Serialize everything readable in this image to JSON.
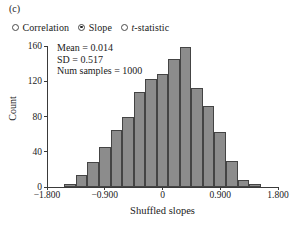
{
  "panel": {
    "label": "(c)"
  },
  "controls": {
    "name": "statistic-selector",
    "options": [
      {
        "label": "Correlation",
        "selected": false,
        "italic_prefix": ""
      },
      {
        "label": "Slope",
        "selected": true,
        "italic_prefix": ""
      },
      {
        "label": "t-statistic",
        "selected": false,
        "italic_prefix": "t"
      }
    ]
  },
  "stats": {
    "mean_line": "Mean = 0.014",
    "sd_line": "SD = 0.517",
    "samples_line": "Num samples = 1000"
  },
  "colors": {
    "bar_fill": "#8c8c8c",
    "bar_stroke": "#444444",
    "axis": "#3a3a3a",
    "text": "#1a1a1a",
    "background": "#ffffff"
  },
  "chart_data": {
    "type": "bar",
    "title": "",
    "subtitle": "",
    "xlabel": "Shuffled slopes",
    "ylabel": "Count",
    "xlim": [
      -1.8,
      1.8
    ],
    "ylim": [
      0,
      160
    ],
    "xticks": [
      -1.8,
      -0.9,
      0,
      0.9,
      1.8
    ],
    "xticklabels": [
      "−1.800",
      "−0.900",
      "0",
      "0.900",
      "1.800"
    ],
    "yticks": [
      0,
      40,
      80,
      120,
      160
    ],
    "yticklabels": [
      "0",
      "40",
      "80",
      "120",
      "160"
    ],
    "grid": false,
    "legend": "none",
    "bin_width": 0.18,
    "bin_centers": [
      -1.44,
      -1.26,
      -1.08,
      -0.9,
      -0.72,
      -0.54,
      -0.36,
      -0.18,
      0.0,
      0.18,
      0.36,
      0.54,
      0.72,
      0.9,
      1.08,
      1.26,
      1.44
    ],
    "values": [
      3,
      14,
      28,
      45,
      65,
      80,
      108,
      123,
      128,
      145,
      159,
      112,
      92,
      62,
      30,
      8,
      3
    ],
    "annotations": [
      "Mean = 0.014",
      "SD = 0.517",
      "Num samples = 1000"
    ]
  }
}
